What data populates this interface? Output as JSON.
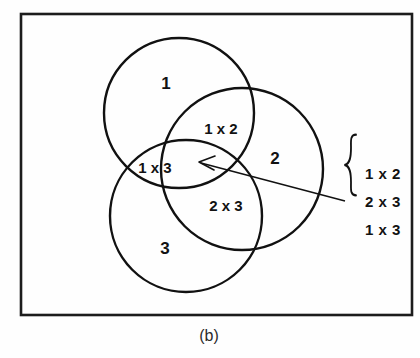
{
  "figure": {
    "caption": "(b)",
    "frame": {
      "color": "#1c1c1c"
    },
    "stroke_color": "#111111",
    "background": "#fefefe",
    "sets": [
      {
        "id": "set-1",
        "label": "1"
      },
      {
        "id": "set-2",
        "label": "2"
      },
      {
        "id": "set-3",
        "label": "3"
      }
    ],
    "intersections": [
      {
        "id": "inter-1-2",
        "label": "1 x 2"
      },
      {
        "id": "inter-1-3",
        "label": "1 x 3"
      },
      {
        "id": "inter-2-3",
        "label": "2 x 3"
      }
    ],
    "center_callout": {
      "id": "triple-intersection",
      "items": [
        {
          "label": "1 x 2"
        },
        {
          "label": "2 x 3"
        },
        {
          "label": "1 x 3"
        }
      ]
    }
  }
}
